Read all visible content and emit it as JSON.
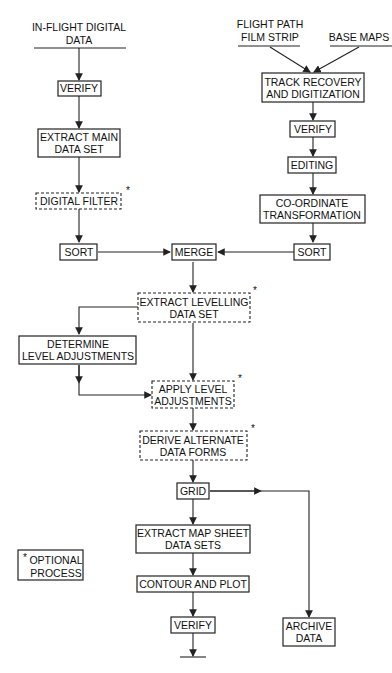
{
  "diagram": {
    "type": "flowchart",
    "sources": [
      {
        "id": "in_flight",
        "lines": [
          "IN-FLIGHT DIGITAL",
          "DATA"
        ]
      },
      {
        "id": "flight_path",
        "lines": [
          "FLIGHT PATH",
          "FILM STRIP"
        ]
      },
      {
        "id": "base_maps",
        "lines": [
          "BASE MAPS"
        ]
      }
    ],
    "nodes": [
      {
        "id": "verify1",
        "lines": [
          "VERIFY"
        ],
        "optional": false
      },
      {
        "id": "extract_main",
        "lines": [
          "EXTRACT MAIN",
          "DATA SET"
        ],
        "optional": false
      },
      {
        "id": "digital_filter",
        "lines": [
          "DIGITAL FILTER"
        ],
        "optional": true
      },
      {
        "id": "sort_left",
        "lines": [
          "SORT"
        ],
        "optional": false
      },
      {
        "id": "track_recovery",
        "lines": [
          "TRACK RECOVERY",
          "AND DIGITIZATION"
        ],
        "optional": false
      },
      {
        "id": "verify2",
        "lines": [
          "VERIFY"
        ],
        "optional": false
      },
      {
        "id": "editing",
        "lines": [
          "EDITING"
        ],
        "optional": false
      },
      {
        "id": "coord_transform",
        "lines": [
          "CO-ORDINATE",
          "TRANSFORMATION"
        ],
        "optional": false
      },
      {
        "id": "sort_right",
        "lines": [
          "SORT"
        ],
        "optional": false
      },
      {
        "id": "merge",
        "lines": [
          "MERGE"
        ],
        "optional": false
      },
      {
        "id": "extract_levelling",
        "lines": [
          "EXTRACT LEVELLING",
          "DATA SET"
        ],
        "optional": true
      },
      {
        "id": "determine_level",
        "lines": [
          "DETERMINE",
          "LEVEL ADJUSTMENTS"
        ],
        "optional": false
      },
      {
        "id": "apply_level",
        "lines": [
          "APPLY LEVEL",
          "ADJUSTMENTS"
        ],
        "optional": true
      },
      {
        "id": "derive_alternate",
        "lines": [
          "DERIVE ALTERNATE",
          "DATA FORMS"
        ],
        "optional": true
      },
      {
        "id": "grid",
        "lines": [
          "GRID"
        ],
        "optional": false
      },
      {
        "id": "extract_map_sheet",
        "lines": [
          "EXTRACT MAP SHEET",
          "DATA SETS"
        ],
        "optional": false
      },
      {
        "id": "contour_plot",
        "lines": [
          "CONTOUR AND PLOT"
        ],
        "optional": false
      },
      {
        "id": "verify3",
        "lines": [
          "VERIFY"
        ],
        "optional": false
      },
      {
        "id": "archive",
        "lines": [
          "ARCHIVE",
          "DATA"
        ],
        "optional": false
      }
    ],
    "edges": [
      [
        "in_flight",
        "verify1"
      ],
      [
        "verify1",
        "extract_main"
      ],
      [
        "extract_main",
        "digital_filter"
      ],
      [
        "digital_filter",
        "sort_left"
      ],
      [
        "flight_path",
        "track_recovery"
      ],
      [
        "base_maps",
        "track_recovery"
      ],
      [
        "track_recovery",
        "verify2"
      ],
      [
        "verify2",
        "editing"
      ],
      [
        "editing",
        "coord_transform"
      ],
      [
        "coord_transform",
        "sort_right"
      ],
      [
        "sort_left",
        "merge"
      ],
      [
        "sort_right",
        "merge"
      ],
      [
        "merge",
        "extract_levelling"
      ],
      [
        "extract_levelling",
        "determine_level"
      ],
      [
        "extract_levelling",
        "apply_level"
      ],
      [
        "determine_level",
        "apply_level"
      ],
      [
        "apply_level",
        "derive_alternate"
      ],
      [
        "derive_alternate",
        "grid"
      ],
      [
        "grid",
        "extract_map_sheet"
      ],
      [
        "grid",
        "archive"
      ],
      [
        "extract_map_sheet",
        "contour_plot"
      ],
      [
        "contour_plot",
        "verify3"
      ],
      [
        "verify3",
        "output"
      ]
    ],
    "legend": {
      "marker": "*",
      "lines": [
        "OPTIONAL",
        "PROCESS"
      ]
    },
    "optional_marker": "*"
  }
}
